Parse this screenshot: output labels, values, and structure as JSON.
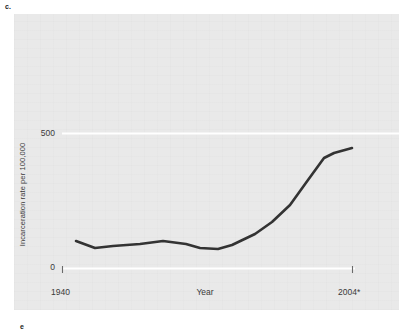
{
  "figure": {
    "part_label_top": "c.",
    "part_label_bottom": "e"
  },
  "chart_data": {
    "type": "line",
    "title": "",
    "xlabel": "Year",
    "ylabel": "Incarceration rate per 100,000",
    "xlim": [
      1940,
      2004
    ],
    "ylim": [
      0,
      620
    ],
    "x_tick_labels": [
      "1940",
      "2004*"
    ],
    "y_tick_labels": [
      "0",
      "500"
    ],
    "y_ticks": [
      0,
      500
    ],
    "x_ticks": [
      1940,
      2004
    ],
    "grid": "horizontal-white-gridlines",
    "legend": "none",
    "footnote_marker": "*",
    "series": [
      {
        "name": "Incarceration rate per 100,000",
        "color": "#333333",
        "x": [
          1942,
          1946,
          1950,
          1955,
          1960,
          1965,
          1968,
          1972,
          1975,
          1980,
          1984,
          1988,
          1992,
          1996,
          2000,
          2004
        ],
        "y": [
          125,
          102,
          110,
          112,
          125,
          113,
          95,
          93,
          112,
          150,
          195,
          260,
          350,
          440,
          455,
          486
        ],
        "points_px": [
          [
            76,
            241
          ],
          [
            95,
            248
          ],
          [
            113,
            246
          ],
          [
            140,
            244
          ],
          [
            163,
            241
          ],
          [
            186,
            244
          ],
          [
            200,
            248
          ],
          [
            218,
            249
          ],
          [
            232,
            245
          ],
          [
            255,
            234
          ],
          [
            272,
            222
          ],
          [
            290,
            205
          ],
          [
            308,
            180
          ],
          [
            324,
            158
          ],
          [
            334,
            153
          ],
          [
            352,
            148
          ]
        ]
      }
    ]
  },
  "axes": {
    "y_axis_label": "Incarceration rate per 100,000",
    "y_tick_500": "500",
    "y_tick_0": "0",
    "x_tick_start": "1940",
    "x_tick_end": "2004*",
    "x_axis_label": "Year"
  },
  "colors": {
    "panel_background": "#e9e9e9",
    "page_background": "#ffffff",
    "line_color": "#333333",
    "gridline_color": "#ffffff",
    "text_color": "#3a3a3a"
  }
}
